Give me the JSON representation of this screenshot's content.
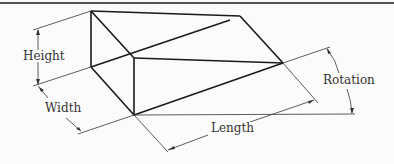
{
  "diagram": {
    "colors": {
      "line": "#1a1a1a",
      "dim_line": "#333333",
      "background": "#fbfbfb"
    },
    "labels": {
      "height": "Height",
      "width": "Width",
      "length": "Length",
      "rotation": "Rotation"
    }
  }
}
